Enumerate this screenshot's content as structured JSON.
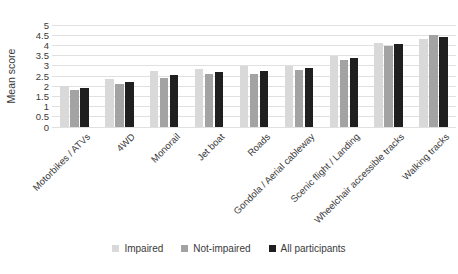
{
  "chart_data": {
    "type": "bar",
    "title": "",
    "ylabel": "Mean score",
    "xlabel": "",
    "ylim": [
      0,
      5
    ],
    "ytick_step": 0.5,
    "grid": true,
    "legend_position": "bottom",
    "background_color": "#ffffff",
    "gridline_color": "#e0e0e0",
    "text_color": "#3a3a3a",
    "categories": [
      "Motorbikes / ATVs",
      "4WD",
      "Monorail",
      "Jet boat",
      "Roads",
      "Gondola / Aerial cableway",
      "Scenic flight / Landing",
      "Wheelchair accessible tracks",
      "Walking tracks"
    ],
    "series": [
      {
        "name": "Impaired",
        "color": "#d9d9d9",
        "values": [
          2.0,
          2.35,
          2.75,
          2.85,
          3.0,
          3.0,
          3.5,
          4.1,
          4.3
        ]
      },
      {
        "name": "Not-impaired",
        "color": "#a3a3a3",
        "values": [
          1.8,
          2.1,
          2.4,
          2.6,
          2.6,
          2.8,
          3.3,
          3.95,
          4.5
        ]
      },
      {
        "name": "All participants",
        "color": "#1f1f1f",
        "values": [
          1.9,
          2.2,
          2.55,
          2.7,
          2.75,
          2.9,
          3.4,
          4.05,
          4.4
        ]
      }
    ]
  }
}
